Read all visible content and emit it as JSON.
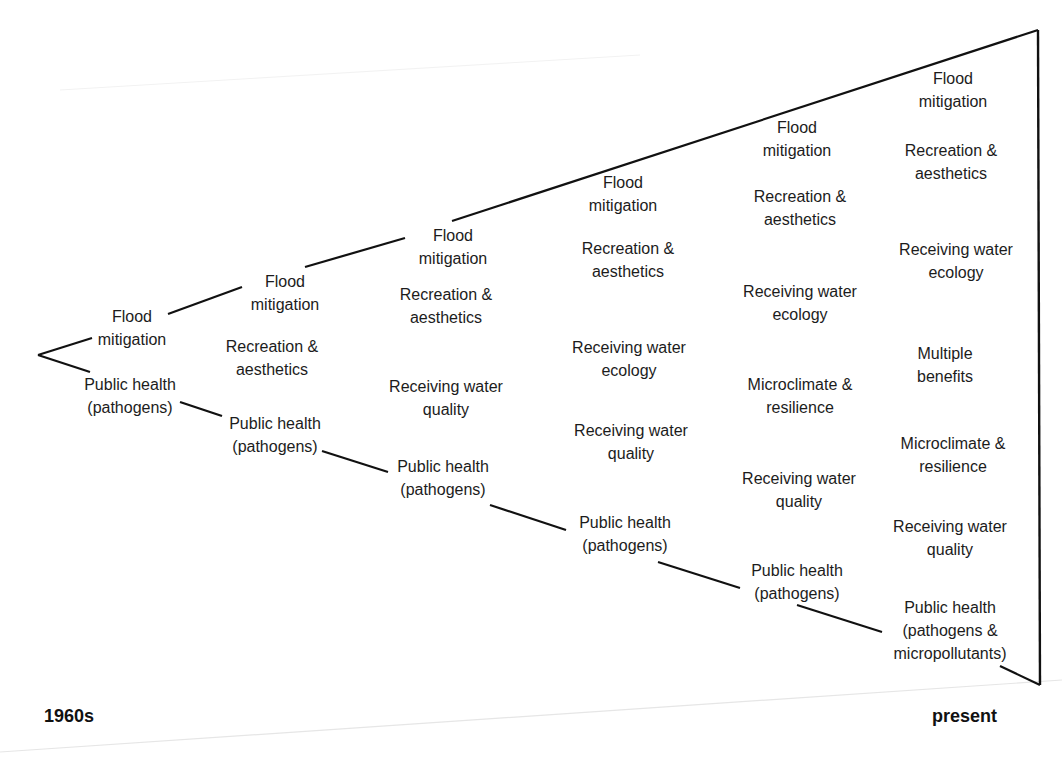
{
  "diagram": {
    "type": "expanding-wedge",
    "era_start": "1960s",
    "era_end": "present",
    "stages": [
      {
        "items": [
          {
            "l1": "Flood",
            "l2": "mitigation",
            "x": 132,
            "y": 305
          },
          {
            "l1": "Public health",
            "l2": "(pathogens)",
            "x": 130,
            "y": 373
          }
        ]
      },
      {
        "items": [
          {
            "l1": "Flood",
            "l2": "mitigation",
            "x": 285,
            "y": 270
          },
          {
            "l1": "Recreation &",
            "l2": "aesthetics",
            "x": 272,
            "y": 335
          },
          {
            "l1": "Public health",
            "l2": "(pathogens)",
            "x": 275,
            "y": 412
          }
        ]
      },
      {
        "items": [
          {
            "l1": "Flood",
            "l2": "mitigation",
            "x": 453,
            "y": 224
          },
          {
            "l1": "Recreation &",
            "l2": "aesthetics",
            "x": 446,
            "y": 283
          },
          {
            "l1": "Receiving water",
            "l2": "quality",
            "x": 446,
            "y": 375
          },
          {
            "l1": "Public health",
            "l2": "(pathogens)",
            "x": 443,
            "y": 455
          }
        ]
      },
      {
        "items": [
          {
            "l1": "Flood",
            "l2": "mitigation",
            "x": 623,
            "y": 171
          },
          {
            "l1": "Recreation &",
            "l2": "aesthetics",
            "x": 628,
            "y": 237
          },
          {
            "l1": "Receiving water",
            "l2": "ecology",
            "x": 629,
            "y": 336
          },
          {
            "l1": "Receiving water",
            "l2": "quality",
            "x": 631,
            "y": 419
          },
          {
            "l1": "Public health",
            "l2": "(pathogens)",
            "x": 625,
            "y": 511
          }
        ]
      },
      {
        "items": [
          {
            "l1": "Flood",
            "l2": "mitigation",
            "x": 797,
            "y": 116
          },
          {
            "l1": "Recreation &",
            "l2": "aesthetics",
            "x": 800,
            "y": 185
          },
          {
            "l1": "Receiving water",
            "l2": "ecology",
            "x": 800,
            "y": 280
          },
          {
            "l1": "Microclimate &",
            "l2": "resilience",
            "x": 800,
            "y": 373
          },
          {
            "l1": "Receiving water",
            "l2": "quality",
            "x": 799,
            "y": 467
          },
          {
            "l1": "Public health",
            "l2": "(pathogens)",
            "x": 797,
            "y": 559
          }
        ]
      },
      {
        "items": [
          {
            "l1": "Flood",
            "l2": "mitigation",
            "x": 953,
            "y": 67
          },
          {
            "l1": "Recreation &",
            "l2": "aesthetics",
            "x": 951,
            "y": 139
          },
          {
            "l1": "Receiving water",
            "l2": "ecology",
            "x": 956,
            "y": 238
          },
          {
            "l1": "Multiple",
            "l2": "benefits",
            "x": 945,
            "y": 342
          },
          {
            "l1": "Microclimate &",
            "l2": "resilience",
            "x": 953,
            "y": 432
          },
          {
            "l1": "Receiving water",
            "l2": "quality",
            "x": 950,
            "y": 515
          },
          {
            "l1": "Public health",
            "l2": "(pathogens &",
            "l3": "micropollutants)",
            "x": 950,
            "y": 596
          }
        ]
      }
    ]
  }
}
